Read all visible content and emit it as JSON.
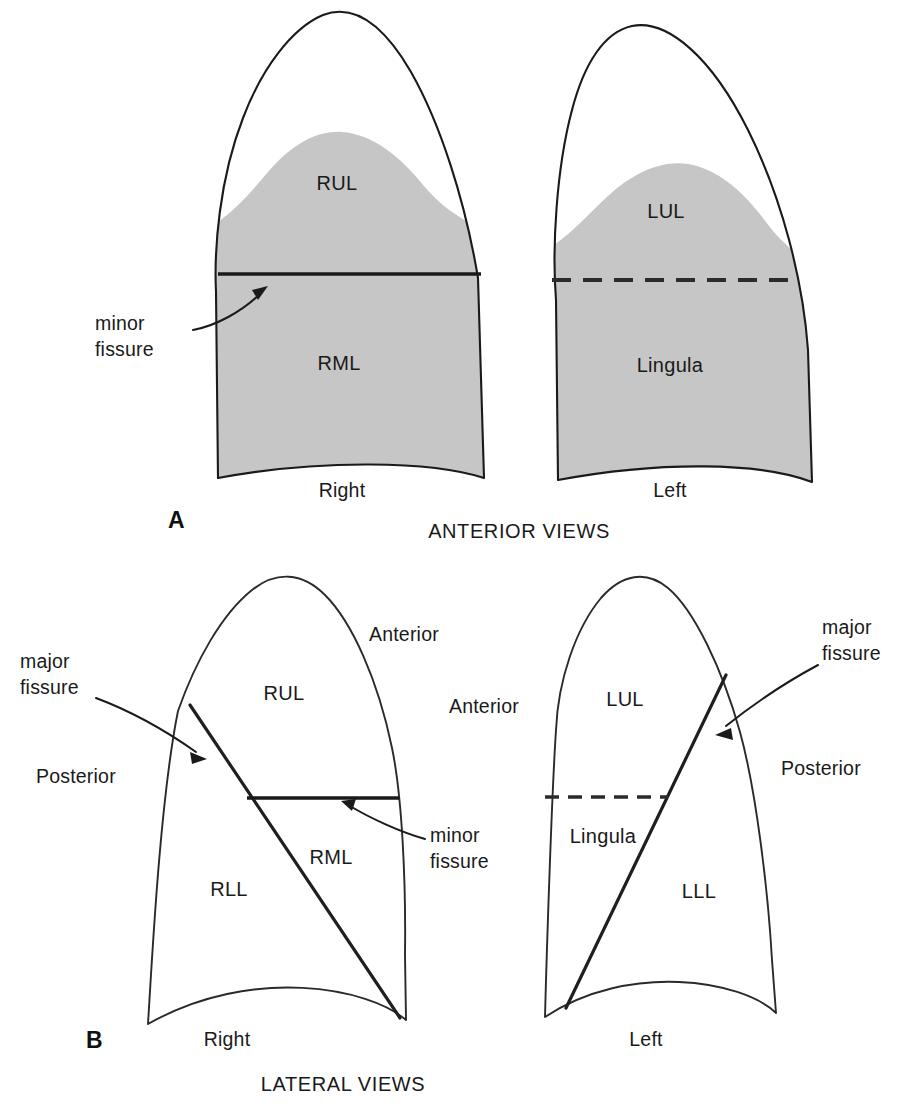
{
  "figure": {
    "background_color": "#ffffff",
    "ink_color": "#1a1a1a",
    "shade_color": "#c6c6c6"
  },
  "panels": [
    {
      "id": "A",
      "panel_label": "A",
      "caption": "ANTERIOR VIEWS",
      "lungs": [
        {
          "side_label": "Right",
          "lobes": [
            "RUL",
            "RML"
          ],
          "fissure_style": "solid",
          "fissure_name": "minor fissure",
          "shaded": true
        },
        {
          "side_label": "Left",
          "lobes": [
            "LUL",
            "Lingula"
          ],
          "fissure_style": "dashed",
          "fissure_name": "minor fissure",
          "shaded": true
        }
      ],
      "annotations": [
        {
          "text_line1": "minor",
          "text_line2": "fissure",
          "points_to": "right-lung-minor-fissure"
        }
      ]
    },
    {
      "id": "B",
      "panel_label": "B",
      "caption": "LATERAL VIEWS",
      "lungs": [
        {
          "side_label": "Right",
          "lobes": [
            "RUL",
            "RML",
            "RLL"
          ],
          "orientation_labels": [
            "Anterior",
            "Posterior"
          ],
          "fissures": [
            "major fissure",
            "minor fissure"
          ],
          "shaded": false
        },
        {
          "side_label": "Left",
          "lobes": [
            "LUL",
            "Lingula",
            "LLL"
          ],
          "orientation_labels": [
            "Anterior",
            "Posterior"
          ],
          "fissures": [
            "major fissure"
          ],
          "shaded": false
        }
      ],
      "annotations": [
        {
          "text_line1": "major",
          "text_line2": "fissure",
          "points_to": "right-lung-major-fissure"
        },
        {
          "text_line1": "minor",
          "text_line2": "fissure",
          "points_to": "right-lung-minor-fissure"
        },
        {
          "text_line1": "major",
          "text_line2": "fissure",
          "points_to": "left-lung-major-fissure"
        }
      ]
    }
  ],
  "labels": {
    "rul": "RUL",
    "rml": "RML",
    "rll": "RLL",
    "lul": "LUL",
    "lll": "LLL",
    "lingula": "Lingula",
    "right": "Right",
    "left": "Left",
    "anterior": "Anterior",
    "posterior": "Posterior",
    "minor_line1": "minor",
    "minor_line2": "fissure",
    "major_line1": "major",
    "major_line2": "fissure",
    "panel_a": "A",
    "panel_b": "B",
    "caption_a": "ANTERIOR VIEWS",
    "caption_b": "LATERAL VIEWS"
  }
}
